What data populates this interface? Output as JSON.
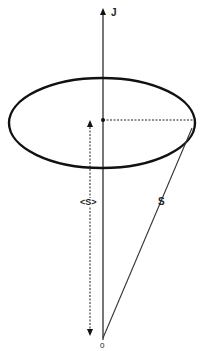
{
  "diagram": {
    "labels": {
      "axis": "J",
      "average_projection": "<S>",
      "vector": "S",
      "origin": "0"
    },
    "colors": {
      "line": "#111111",
      "axis": "#555555",
      "background": "#ffffff"
    }
  }
}
